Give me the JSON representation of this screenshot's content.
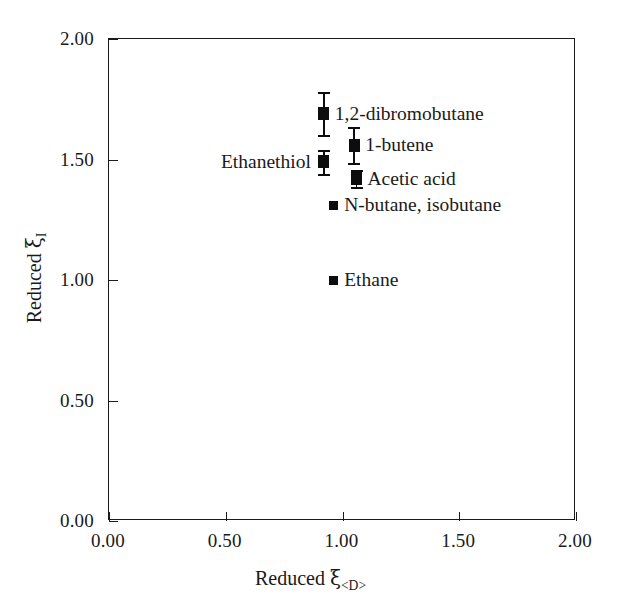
{
  "chart_data": {
    "type": "scatter",
    "title": "",
    "xlabel": "Reduced ξ<D>",
    "ylabel": "Reduced ξI",
    "xlabel_base": "Reduced ",
    "xlabel_symbol": "ξ",
    "xlabel_subscript": "<D>",
    "ylabel_base": "Reduced ",
    "ylabel_symbol": "ξ",
    "ylabel_subscript": "I",
    "xlim": [
      0.0,
      2.0
    ],
    "ylim": [
      0.0,
      2.0
    ],
    "xticks": [
      "0.00",
      "0.50",
      "1.00",
      "1.50",
      "2.00"
    ],
    "xtick_values": [
      0.0,
      0.5,
      1.0,
      1.5,
      2.0
    ],
    "yticks": [
      "0.00",
      "0.50",
      "1.00",
      "1.50",
      "2.00"
    ],
    "ytick_values": [
      0.0,
      0.5,
      1.0,
      1.5,
      2.0
    ],
    "grid": false,
    "legend": "none",
    "marker_color": "#0d0d0d",
    "axis_color": "#1a1a1a",
    "background": "#ffffff",
    "points": [
      {
        "label": "1,2-dibromobutane",
        "x": 0.92,
        "y": 1.69,
        "yerr": 0.09,
        "label_side": "right",
        "marker": "square"
      },
      {
        "label": "1-butene",
        "x": 1.05,
        "y": 1.56,
        "yerr": 0.075,
        "label_side": "right",
        "marker": "square"
      },
      {
        "label": "Ethanethiol",
        "x": 0.92,
        "y": 1.49,
        "yerr": 0.05,
        "label_side": "left",
        "marker": "square"
      },
      {
        "label": "Acetic acid",
        "x": 1.06,
        "y": 1.42,
        "yerr": 0.035,
        "label_side": "right",
        "marker": "square"
      },
      {
        "label": "N-butane, isobutane",
        "x": 0.96,
        "y": 1.31,
        "yerr": 0.0,
        "label_side": "right",
        "marker": "square-small"
      },
      {
        "label": "Ethane",
        "x": 0.96,
        "y": 1.0,
        "yerr": 0.0,
        "label_side": "right",
        "marker": "square-small"
      }
    ]
  }
}
